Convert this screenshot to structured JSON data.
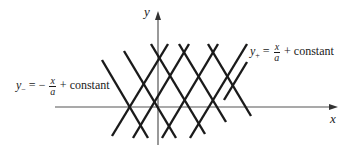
{
  "figure": {
    "type": "characteristics-lattice",
    "axes": {
      "x_label": "x",
      "y_label": "y",
      "origin_px": [
        158,
        107
      ],
      "x_axis_px": {
        "from": 55,
        "to": 337
      },
      "y_axis_px": {
        "from": 145,
        "to": 12
      }
    },
    "families": [
      {
        "name": "y_plus",
        "label_lhs": "y",
        "label_sub": "+",
        "equals": "=",
        "sign": "",
        "frac_num": "x",
        "frac_den": "a",
        "rest": "+ constant",
        "slope": "positive",
        "count": 5
      },
      {
        "name": "y_minus",
        "label_lhs": "y",
        "label_sub": "−",
        "equals": "=",
        "sign": "−",
        "frac_num": "x",
        "frac_den": "a",
        "rest": "+ constant",
        "slope": "negative",
        "count": 5
      }
    ],
    "line_color": "#1a1a1a",
    "axis_color": "#555555"
  }
}
